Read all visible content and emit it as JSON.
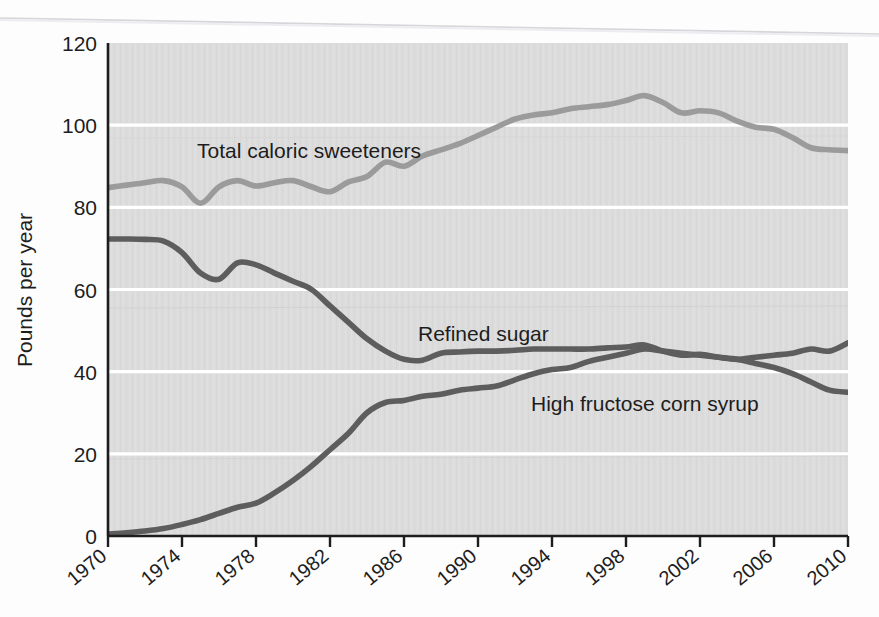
{
  "figure": {
    "background_color": "#fdfdfd",
    "plot_background_color": "#dcdcdc",
    "gridline_color": "#ffffff",
    "axis_color": "#1d1d1d"
  },
  "chart_data": {
    "type": "line",
    "title": "",
    "subtitle": "",
    "xlabel": "",
    "ylabel": "Pounds per year",
    "xlim": [
      1970,
      2010
    ],
    "ylim": [
      0,
      120
    ],
    "grid": true,
    "grid_axis": "y",
    "legend_position": "inline-labels",
    "xticks": [
      "1970",
      "1974",
      "1978",
      "1982",
      "1986",
      "1990",
      "1994",
      "1998",
      "2002",
      "2006",
      "2010"
    ],
    "xtick_values": [
      1970,
      1974,
      1978,
      1982,
      1986,
      1990,
      1994,
      1998,
      2002,
      2006,
      2010
    ],
    "yticks": [
      "0",
      "20",
      "40",
      "60",
      "80",
      "100",
      "120"
    ],
    "ytick_values": [
      0,
      20,
      40,
      60,
      80,
      100,
      120
    ],
    "x": [
      1970,
      1971,
      1972,
      1973,
      1974,
      1975,
      1976,
      1977,
      1978,
      1979,
      1980,
      1981,
      1982,
      1983,
      1984,
      1985,
      1986,
      1987,
      1988,
      1989,
      1990,
      1991,
      1992,
      1993,
      1994,
      1995,
      1996,
      1997,
      1998,
      1999,
      2000,
      2001,
      2002,
      2003,
      2004,
      2005,
      2006,
      2007,
      2008,
      2009,
      2010
    ],
    "series": [
      {
        "name": "Total caloric sweeteners",
        "color": "#9b9b9b",
        "label_text": "Total caloric sweeteners",
        "values": [
          84.8,
          85.4,
          86.0,
          86.5,
          85.0,
          81.0,
          85.0,
          86.5,
          85.2,
          86.0,
          86.5,
          85.0,
          83.8,
          86.2,
          87.5,
          91.0,
          90.0,
          92.5,
          94.0,
          95.5,
          97.5,
          99.5,
          101.5,
          102.5,
          103.0,
          104.0,
          104.5,
          105.0,
          106.0,
          107.2,
          105.5,
          103.0,
          103.5,
          103.0,
          101.0,
          99.5,
          99.0,
          97.0,
          94.5,
          94.0,
          93.8
        ]
      },
      {
        "name": "Refined sugar",
        "color": "#5d5d5d",
        "label_text": "Refined sugar",
        "values": [
          72.3,
          72.3,
          72.2,
          71.8,
          69.0,
          64.0,
          62.5,
          66.5,
          66.0,
          64.0,
          62.0,
          60.0,
          56.0,
          52.0,
          48.0,
          45.0,
          43.0,
          42.8,
          44.5,
          44.8,
          45.0,
          45.0,
          45.2,
          45.5,
          45.5,
          45.5,
          45.5,
          45.8,
          46.0,
          46.5,
          45.0,
          44.0,
          44.2,
          43.5,
          43.0,
          43.5,
          44.0,
          44.5,
          45.5,
          45.0,
          47.0
        ]
      },
      {
        "name": "High fructose corn syrup",
        "color": "#5d5d5d",
        "label_text": "High fructose corn syrup",
        "values": [
          0.5,
          0.8,
          1.2,
          1.8,
          2.8,
          4.0,
          5.5,
          7.0,
          8.0,
          10.5,
          13.5,
          17.0,
          21.0,
          25.0,
          30.0,
          32.5,
          33.0,
          34.0,
          34.5,
          35.5,
          36.0,
          36.5,
          38.0,
          39.5,
          40.5,
          41.0,
          42.5,
          43.5,
          44.5,
          45.5,
          45.0,
          44.5,
          44.0,
          43.5,
          43.0,
          42.0,
          41.0,
          39.5,
          37.5,
          35.5,
          35.0
        ]
      }
    ],
    "annotations": [
      {
        "text": "Total caloric sweeteners",
        "x_px": 197,
        "y_px": 158
      },
      {
        "text": "Refined sugar",
        "x_px": 418,
        "y_px": 341
      },
      {
        "text": "High fructose corn syrup",
        "x_px": 531,
        "y_px": 411
      }
    ]
  }
}
